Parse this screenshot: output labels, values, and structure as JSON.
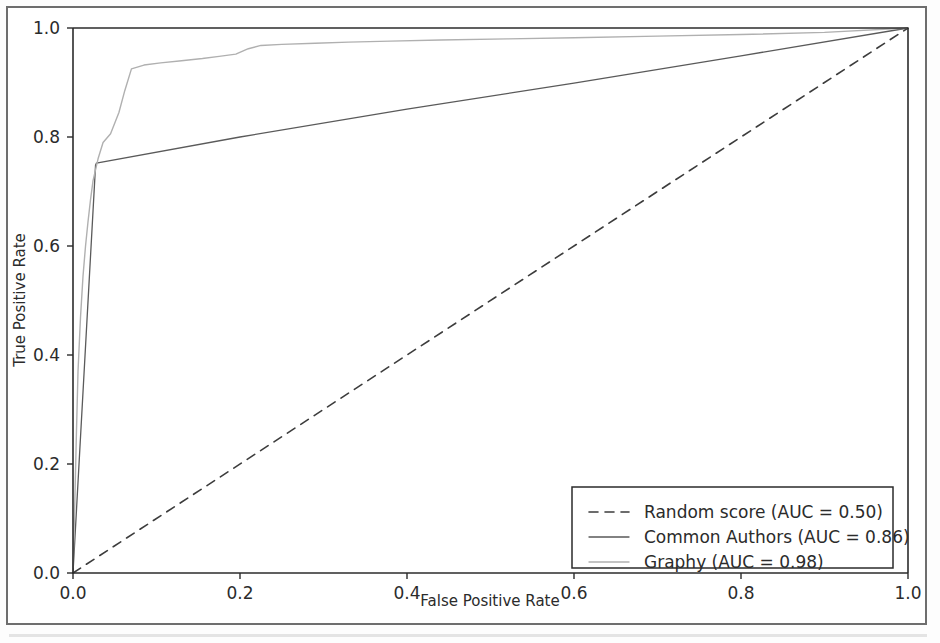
{
  "chart_data": {
    "type": "line",
    "title": "",
    "xlabel": "False Positive Rate",
    "ylabel": "True Positive Rate",
    "xlim": [
      0.0,
      1.0
    ],
    "ylim": [
      0.0,
      1.0
    ],
    "grid": false,
    "legend_position": "lower right",
    "xticks": [
      "0.0",
      "0.2",
      "0.4",
      "0.6",
      "0.8",
      "1.0"
    ],
    "xtick_values": [
      0.0,
      0.2,
      0.4,
      0.6,
      0.8,
      1.0
    ],
    "yticks": [
      "0.0",
      "0.2",
      "0.4",
      "0.6",
      "0.8",
      "1.0"
    ],
    "ytick_values": [
      0.0,
      0.2,
      0.4,
      0.6,
      0.8,
      1.0
    ],
    "series": [
      {
        "name": "Random score (AUC = 0.50)",
        "label": "Random score (AUC = 0.50)",
        "auc": 0.5,
        "color": "#3c3c3c",
        "style": "dashed",
        "width": 1.6,
        "x": [
          0.0,
          1.0
        ],
        "values": [
          0.0,
          1.0
        ]
      },
      {
        "name": "Common Authors (AUC = 0.86)",
        "label": "Common Authors (AUC = 0.86)",
        "auc": 0.86,
        "color": "#5a5a5a",
        "style": "solid",
        "width": 1.3,
        "x": [
          0.0,
          0.027,
          0.028,
          0.2,
          0.4,
          0.6,
          0.8,
          1.0
        ],
        "values": [
          0.0,
          0.748,
          0.752,
          0.8,
          0.851,
          0.899,
          0.949,
          1.0
        ]
      },
      {
        "name": "Graphy (AUC = 0.98)",
        "label": "Graphy (AUC = 0.98)",
        "auc": 0.98,
        "color": "#b0b0b0",
        "style": "solid",
        "width": 1.4,
        "x": [
          0.0,
          0.002,
          0.004,
          0.006,
          0.009,
          0.012,
          0.015,
          0.018,
          0.021,
          0.024,
          0.03,
          0.036,
          0.045,
          0.055,
          0.062,
          0.07,
          0.085,
          0.105,
          0.13,
          0.155,
          0.175,
          0.195,
          0.21,
          0.225,
          0.25,
          0.29,
          0.33,
          0.38,
          0.44,
          0.52,
          0.6,
          0.7,
          0.8,
          0.9,
          1.0
        ],
        "values": [
          0.01,
          0.12,
          0.25,
          0.37,
          0.47,
          0.545,
          0.6,
          0.645,
          0.685,
          0.72,
          0.76,
          0.79,
          0.806,
          0.845,
          0.885,
          0.925,
          0.932,
          0.936,
          0.94,
          0.944,
          0.948,
          0.952,
          0.962,
          0.968,
          0.97,
          0.972,
          0.974,
          0.976,
          0.978,
          0.98,
          0.982,
          0.985,
          0.988,
          0.992,
          1.0
        ]
      }
    ]
  },
  "axes": {
    "xlabel": "False Positive Rate",
    "ylabel": "True Positive Rate"
  },
  "legend": {
    "entries": [
      {
        "label": "Random score (AUC = 0.50)"
      },
      {
        "label": "Common Authors (AUC = 0.86)"
      },
      {
        "label": "Graphy (AUC = 0.98)"
      }
    ]
  },
  "colors": {
    "axis": "#2b2b2b",
    "frame": "#6e6e6e",
    "random": "#3c3c3c",
    "common_authors": "#5a5a5a",
    "graphy": "#b0b0b0",
    "background": "#ffffff"
  }
}
